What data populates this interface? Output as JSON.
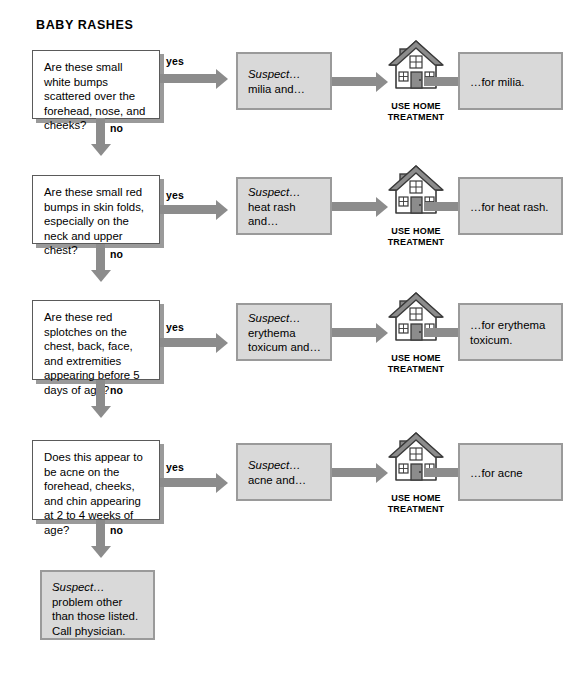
{
  "title": "BABY RASHES",
  "labels": {
    "yes": "yes",
    "no": "no"
  },
  "home_treatment_caption_line1": "USE HOME",
  "home_treatment_caption_line2": "TREATMENT",
  "icons": {
    "home": "house-icon",
    "arrow_right": "arrow-right-icon",
    "arrow_down": "arrow-down-icon"
  },
  "colors": {
    "box_fill": "#d9d9d9",
    "box_border": "#9a9a9a",
    "question_fill": "#ffffff",
    "question_border": "#5a5a5a",
    "arrow": "#8c8c8c",
    "text": "#000000",
    "shadow": "#9a9a9a"
  },
  "rows": [
    {
      "question": "Are these small white bumps scattered over the forehead, nose, and cheeks?",
      "suspect_lead": "Suspect…",
      "suspect_body": "milia and…",
      "result": "…for milia."
    },
    {
      "question": "Are these small red bumps in skin folds, especially on the neck and upper chest?",
      "suspect_lead": "Suspect…",
      "suspect_body": "heat rash and…",
      "result": "…for heat rash."
    },
    {
      "question": "Are these red splotches on the chest, back, face, and extremities appearing before 5 days of age?",
      "suspect_lead": "Suspect…",
      "suspect_body": "erythema toxicum and…",
      "result": "…for erythema toxicum."
    },
    {
      "question": "Does this appear to be acne on the forehead, cheeks, and chin appearing at 2 to 4 weeks of age?",
      "suspect_lead": "Suspect…",
      "suspect_body": "acne and…",
      "result": "…for acne"
    }
  ],
  "final": {
    "lead": "Suspect…",
    "body": "problem other than those listed. Call physician."
  }
}
